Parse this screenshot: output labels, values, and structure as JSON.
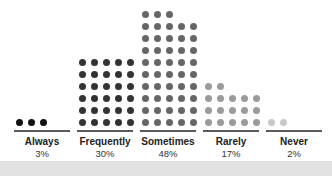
{
  "chart_data": {
    "type": "pictogram",
    "title": "",
    "categories": [
      "Always",
      "Frequently",
      "Sometimes",
      "Rarely",
      "Never"
    ],
    "values": [
      3,
      30,
      48,
      17,
      2
    ],
    "value_labels": [
      "3%",
      "30%",
      "48%",
      "17%",
      "2%"
    ],
    "unit": "%",
    "dots_per_row": 5,
    "colors": [
      "#111111",
      "#333333",
      "#666666",
      "#9a9a9a",
      "#c8c8c8"
    ],
    "legend": null,
    "grid": false
  },
  "columns": [
    {
      "label": "Always",
      "pct": "3%",
      "count": 3,
      "color": "#111111",
      "x": 14
    },
    {
      "label": "Frequently",
      "pct": "30%",
      "count": 30,
      "color": "#333333",
      "x": 77
    },
    {
      "label": "Sometimes",
      "pct": "48%",
      "count": 48,
      "color": "#666666",
      "x": 140
    },
    {
      "label": "Rarely",
      "pct": "17%",
      "count": 17,
      "color": "#9a9a9a",
      "x": 203
    },
    {
      "label": "Never",
      "pct": "2%",
      "count": 2,
      "color": "#c8c8c8",
      "x": 266
    }
  ]
}
